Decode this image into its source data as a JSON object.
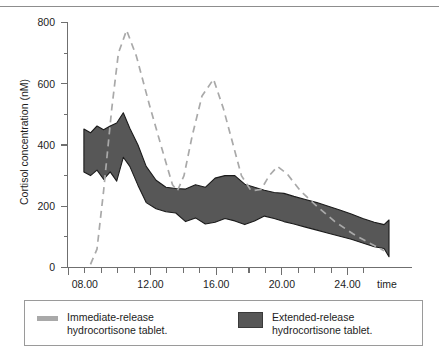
{
  "chart_data": {
    "type": "area",
    "title": "",
    "xlabel": "time",
    "ylabel": "Cortisol concentration (nM)",
    "xlim": [
      6,
      27
    ],
    "ylim": [
      0,
      800
    ],
    "grid": false,
    "x_tick_labels": [
      "08.00",
      "12.00",
      "16.00",
      "20.00",
      "24.00"
    ],
    "x_tick_values": [
      8,
      12,
      16,
      20,
      24
    ],
    "x_minor_tick_step": 1,
    "y_tick_labels": [
      "0",
      "200",
      "400",
      "600",
      "800"
    ],
    "y_tick_values": [
      0,
      200,
      400,
      600,
      800
    ],
    "y_minor_tick_step": 100,
    "legend_position": "below-plot",
    "series": [
      {
        "name": "Immediate-release hydrocortisone tablet.",
        "type": "line",
        "style": "dashed",
        "color": "#a9a9a9",
        "x": [
          7.4,
          7.8,
          8.2,
          8.7,
          9.1,
          9.6,
          10.2,
          11.0,
          11.8,
          12.4,
          12.7,
          13.1,
          13.6,
          14.2,
          14.9,
          15.5,
          16.1,
          16.6,
          17.2,
          17.8,
          18.3,
          18.8,
          19.4,
          20.2,
          21.2,
          22.3,
          23.4,
          24.4,
          25.3
        ],
        "y": [
          10,
          60,
          250,
          520,
          700,
          775,
          690,
          530,
          380,
          270,
          250,
          300,
          430,
          560,
          615,
          520,
          400,
          300,
          250,
          255,
          300,
          330,
          305,
          250,
          200,
          150,
          110,
          80,
          55
        ]
      },
      {
        "name": "Extended-release hydrocortisone tablet.",
        "type": "band",
        "color": "#575757",
        "x": [
          7.0,
          7.4,
          7.8,
          8.2,
          8.6,
          9.0,
          9.4,
          9.8,
          10.3,
          10.8,
          11.4,
          12.0,
          12.6,
          13.2,
          13.8,
          14.4,
          15.0,
          15.6,
          16.2,
          16.8,
          17.4,
          18.0,
          18.6,
          19.2,
          19.8,
          20.5,
          21.2,
          21.9,
          22.6,
          23.3,
          24.0,
          24.7,
          25.3,
          25.6
        ],
        "y_upper": [
          452,
          440,
          462,
          450,
          462,
          472,
          505,
          455,
          400,
          330,
          285,
          262,
          258,
          256,
          270,
          262,
          292,
          300,
          300,
          272,
          262,
          252,
          245,
          242,
          232,
          222,
          212,
          200,
          188,
          175,
          160,
          148,
          140,
          155
        ],
        "y_lower": [
          312,
          300,
          318,
          288,
          312,
          282,
          360,
          330,
          268,
          212,
          192,
          182,
          178,
          150,
          162,
          142,
          148,
          160,
          152,
          140,
          152,
          168,
          160,
          150,
          142,
          132,
          122,
          112,
          102,
          92,
          80,
          68,
          62,
          35
        ]
      }
    ]
  },
  "legend": {
    "entries": [
      {
        "swatch": "ir-dash-swatch",
        "label": "Immediate-release\nhydrocortisone tablet."
      },
      {
        "swatch": "er-fill-swatch",
        "label": "Extended-release\nhydrocortisone tablet."
      }
    ]
  },
  "axes": {
    "y_title": "Cortisol concentration (nM)",
    "x_title": "time",
    "y_labels": [
      "800",
      "600",
      "400",
      "200",
      "0"
    ],
    "x_labels": [
      "08.00",
      "12.00",
      "16.00",
      "20.00",
      "24.00"
    ]
  },
  "colors": {
    "band_fill": "#575757",
    "band_stroke": "#1b1b1b",
    "dashed_line": "#a9a9a9",
    "axis": "#6f6f6f",
    "text": "#1d1d1d",
    "legend_border": "#9a9a9a"
  }
}
